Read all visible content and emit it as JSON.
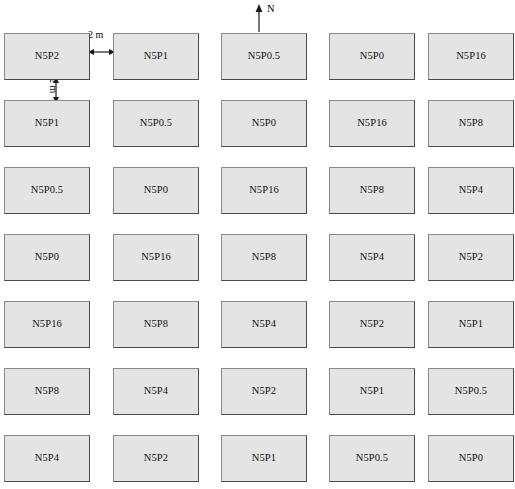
{
  "figure": {
    "background_color": "#ffffff",
    "plot_fill_color": "#e4e4e4",
    "plot_border_color": "#4a4a4a"
  },
  "north_indicator": {
    "label": "N",
    "icon": "north-arrow-icon",
    "direction": "up"
  },
  "dimensions": {
    "horizontal_gap": {
      "label": "2 m",
      "icon": "double-headed-horizontal-arrow-icon"
    },
    "vertical_gap": {
      "label": "2 m",
      "icon": "double-headed-vertical-arrow-icon"
    }
  },
  "grid": {
    "rows": 7,
    "columns": 5,
    "plots": [
      [
        {
          "label": "N5P2"
        },
        {
          "label": "N5P1"
        },
        {
          "label": "N5P0.5"
        },
        {
          "label": "N5P0"
        },
        {
          "label": "N5P16"
        }
      ],
      [
        {
          "label": "N5P1"
        },
        {
          "label": "N5P0.5"
        },
        {
          "label": "N5P0"
        },
        {
          "label": "N5P16"
        },
        {
          "label": "N5P8"
        }
      ],
      [
        {
          "label": "N5P0.5"
        },
        {
          "label": "N5P0"
        },
        {
          "label": "N5P16"
        },
        {
          "label": "N5P8"
        },
        {
          "label": "N5P4"
        }
      ],
      [
        {
          "label": "N5P0"
        },
        {
          "label": "N5P16"
        },
        {
          "label": "N5P8"
        },
        {
          "label": "N5P4"
        },
        {
          "label": "N5P2"
        }
      ],
      [
        {
          "label": "N5P16"
        },
        {
          "label": "N5P8"
        },
        {
          "label": "N5P4"
        },
        {
          "label": "N5P2"
        },
        {
          "label": "N5P1"
        }
      ],
      [
        {
          "label": "N5P8"
        },
        {
          "label": "N5P4"
        },
        {
          "label": "N5P2"
        },
        {
          "label": "N5P1"
        },
        {
          "label": "N5P0.5"
        }
      ],
      [
        {
          "label": "N5P4"
        },
        {
          "label": "N5P2"
        },
        {
          "label": "N5P1"
        },
        {
          "label": "N5P0.5"
        },
        {
          "label": "N5P0"
        }
      ]
    ]
  },
  "layout_metrics": {
    "column_x": [
      4,
      113,
      221,
      329,
      428
    ],
    "row_y": [
      33,
      100,
      167,
      234,
      301,
      368,
      435
    ],
    "plot_width": 86,
    "plot_height": 47
  }
}
